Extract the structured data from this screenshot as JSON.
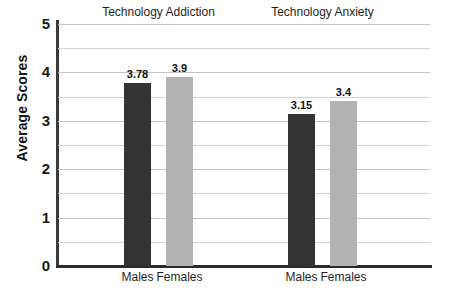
{
  "chart_data": {
    "type": "bar",
    "title": "",
    "xlabel": "",
    "ylabel": "Average Scores",
    "ylim": [
      0,
      5
    ],
    "ytick_labels": [
      "0",
      "1",
      "2",
      "3",
      "4",
      "5"
    ],
    "ytick_values": [
      0,
      1,
      2,
      3,
      4,
      5
    ],
    "grid": true,
    "minor_gridline_step": 0.5,
    "legend": "none",
    "groups": [
      {
        "label": "Technology Addiction",
        "categories": [
          "Males",
          "Females"
        ],
        "values": [
          3.78,
          3.9
        ],
        "value_labels": [
          "3.78",
          "3.9"
        ],
        "colors": [
          "#333333",
          "#b3b3b3"
        ]
      },
      {
        "label": "Technology Anxiety",
        "categories": [
          "Males",
          "Females"
        ],
        "values": [
          3.15,
          3.4
        ],
        "value_labels": [
          "3.15",
          "3.4"
        ],
        "colors": [
          "#333333",
          "#b3b3b3"
        ]
      }
    ],
    "series": [
      {
        "name": "Males",
        "values": [
          3.78,
          3.15
        ],
        "color": "#333333"
      },
      {
        "name": "Females",
        "values": [
          3.9,
          3.4
        ],
        "color": "#b3b3b3"
      }
    ],
    "categories": [
      "Technology Addiction",
      "Technology Anxiety"
    ],
    "colors": {
      "males_bar": "#333333",
      "females_bar": "#b3b3b3",
      "axis": "#333333",
      "gridline": "#d2d2d2",
      "background": "#ffffff",
      "text": "#1a1a1a"
    }
  }
}
